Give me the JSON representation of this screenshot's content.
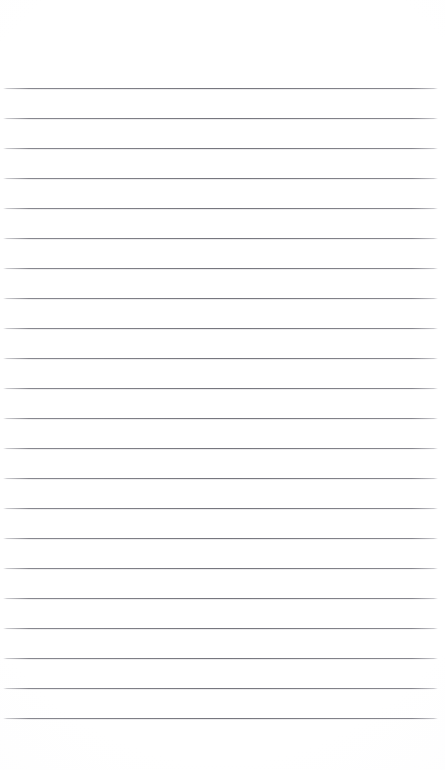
{
  "page": {
    "kind": "lined-notepad-page",
    "width": 445,
    "height": 770,
    "background_color": "#fdfdfd",
    "content_text": ""
  },
  "header_margin": {
    "label": "",
    "top": 0,
    "height": 88
  },
  "rules": {
    "label": "",
    "count": 22,
    "first_line_y": 88,
    "spacing": 30,
    "line_color": "#767680",
    "line_thickness": 1,
    "left_inset": 3,
    "right_inset": 7,
    "lines": [
      {
        "index": 1,
        "y": 88,
        "text": ""
      },
      {
        "index": 2,
        "y": 118,
        "text": ""
      },
      {
        "index": 3,
        "y": 148,
        "text": ""
      },
      {
        "index": 4,
        "y": 178,
        "text": ""
      },
      {
        "index": 5,
        "y": 208,
        "text": ""
      },
      {
        "index": 6,
        "y": 238,
        "text": ""
      },
      {
        "index": 7,
        "y": 268,
        "text": ""
      },
      {
        "index": 8,
        "y": 298,
        "text": ""
      },
      {
        "index": 9,
        "y": 328,
        "text": ""
      },
      {
        "index": 10,
        "y": 358,
        "text": ""
      },
      {
        "index": 11,
        "y": 388,
        "text": ""
      },
      {
        "index": 12,
        "y": 418,
        "text": ""
      },
      {
        "index": 13,
        "y": 448,
        "text": ""
      },
      {
        "index": 14,
        "y": 478,
        "text": ""
      },
      {
        "index": 15,
        "y": 508,
        "text": ""
      },
      {
        "index": 16,
        "y": 538,
        "text": ""
      },
      {
        "index": 17,
        "y": 568,
        "text": ""
      },
      {
        "index": 18,
        "y": 598,
        "text": ""
      },
      {
        "index": 19,
        "y": 628,
        "text": ""
      },
      {
        "index": 20,
        "y": 658,
        "text": ""
      },
      {
        "index": 21,
        "y": 688,
        "text": ""
      },
      {
        "index": 22,
        "y": 718,
        "text": ""
      }
    ]
  },
  "footer_margin": {
    "label": "",
    "top": 719,
    "height": 51
  }
}
